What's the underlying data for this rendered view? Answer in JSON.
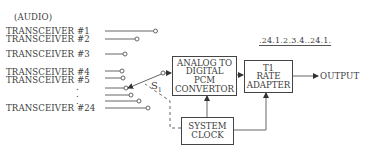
{
  "diagram": {
    "type": "block-diagram",
    "title_label": "(AUDIO)",
    "inputs": [
      {
        "label": "TRANSCEIVER #1"
      },
      {
        "label": "TRANSCEIVER #2"
      },
      {
        "label": "TRANSCEIVER #3"
      },
      {
        "label": "TRANSCEIVER #4"
      },
      {
        "label": "TRANSCEIVER #5"
      },
      {
        "label": "."
      },
      {
        "label": "."
      },
      {
        "label": "."
      },
      {
        "label": "TRANSCEIVER #24"
      }
    ],
    "switch_label": "S",
    "switch_subscript": "1",
    "blocks": {
      "adc": {
        "lines": [
          "ANALOG TO",
          "DIGITAL",
          "PCM",
          "CONVERTOR"
        ]
      },
      "t1": {
        "lines": [
          "T1",
          "RATE",
          "ADAPTER"
        ]
      },
      "clock": {
        "lines": [
          "SYSTEM",
          "CLOCK"
        ]
      }
    },
    "output_label": "OUTPUT",
    "frame_sequence_label": ".24.1.2.3.4..24.1.",
    "colors": {
      "line": "#444444",
      "text": "#3c3c3c",
      "background": "#ffffff"
    }
  }
}
